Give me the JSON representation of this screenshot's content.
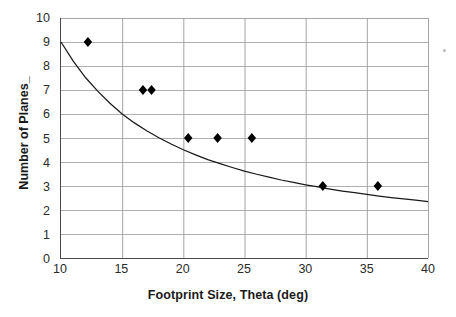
{
  "chart_data": {
    "type": "scatter",
    "title": "",
    "xlabel": "Footprint Size, Theta (deg)",
    "ylabel": "Number of Planes_",
    "xlim": [
      10,
      40
    ],
    "ylim": [
      0,
      10
    ],
    "grid": true,
    "legend": "none",
    "xticks": [
      10,
      15,
      20,
      25,
      30,
      35,
      40
    ],
    "yticks": [
      0,
      1,
      2,
      3,
      4,
      5,
      6,
      7,
      8,
      9,
      10
    ],
    "xtick_labels": [
      "10",
      "15",
      "20",
      "25",
      "30",
      "35",
      "40"
    ],
    "ytick_labels": [
      "0",
      "1",
      "2",
      "3",
      "4",
      "5",
      "6",
      "7",
      "8",
      "9",
      "10"
    ],
    "series": [
      {
        "name": "Data points",
        "type": "scatter",
        "marker": "diamond",
        "color": "#000000",
        "points": [
          {
            "x": 12.2,
            "y": 9
          },
          {
            "x": 16.7,
            "y": 7
          },
          {
            "x": 17.4,
            "y": 7
          },
          {
            "x": 20.4,
            "y": 5
          },
          {
            "x": 22.8,
            "y": 5
          },
          {
            "x": 25.6,
            "y": 5
          },
          {
            "x": 31.4,
            "y": 3
          },
          {
            "x": 35.9,
            "y": 3
          }
        ]
      },
      {
        "name": "Fitted curve",
        "type": "line",
        "color": "#1a1a1a",
        "points": [
          {
            "x": 10.0,
            "y": 9.0
          },
          {
            "x": 11.0,
            "y": 8.2
          },
          {
            "x": 12.0,
            "y": 7.52
          },
          {
            "x": 13.0,
            "y": 6.95
          },
          {
            "x": 14.0,
            "y": 6.45
          },
          {
            "x": 15.0,
            "y": 6.0
          },
          {
            "x": 16.0,
            "y": 5.63
          },
          {
            "x": 17.0,
            "y": 5.3
          },
          {
            "x": 18.0,
            "y": 5.01
          },
          {
            "x": 19.0,
            "y": 4.75
          },
          {
            "x": 20.0,
            "y": 4.51
          },
          {
            "x": 21.0,
            "y": 4.3
          },
          {
            "x": 22.0,
            "y": 4.1
          },
          {
            "x": 23.0,
            "y": 3.93
          },
          {
            "x": 24.0,
            "y": 3.77
          },
          {
            "x": 25.0,
            "y": 3.62
          },
          {
            "x": 26.0,
            "y": 3.49
          },
          {
            "x": 27.0,
            "y": 3.37
          },
          {
            "x": 28.0,
            "y": 3.25
          },
          {
            "x": 29.0,
            "y": 3.15
          },
          {
            "x": 30.0,
            "y": 3.05
          },
          {
            "x": 31.0,
            "y": 2.96
          },
          {
            "x": 32.0,
            "y": 2.87
          },
          {
            "x": 33.0,
            "y": 2.79
          },
          {
            "x": 34.0,
            "y": 2.72
          },
          {
            "x": 35.0,
            "y": 2.65
          },
          {
            "x": 36.0,
            "y": 2.58
          },
          {
            "x": 37.0,
            "y": 2.52
          },
          {
            "x": 38.0,
            "y": 2.46
          },
          {
            "x": 39.0,
            "y": 2.41
          },
          {
            "x": 40.0,
            "y": 2.35
          }
        ]
      }
    ],
    "colors": {
      "marker": "#000000",
      "curve": "#1a1a1a",
      "grid": "#9a9a9a",
      "axis": "#4a4a4a",
      "text": "#2b2b2b",
      "background": "#ffffff"
    }
  }
}
